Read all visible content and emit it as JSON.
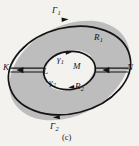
{
  "figure": {
    "caption": "(c)",
    "background_color": "#f4f2ef",
    "region_fill_color": "#bdbdbd",
    "hole_fill_color": "#f4f2ef",
    "stroke_color": "#141414",
    "labels": {
      "outer_top_curve": "Γ",
      "outer_top_curve_sub": "1",
      "outer_bottom_curve": "Γ",
      "outer_bottom_curve_sub": "2",
      "inner_top_curve": "γ",
      "inner_top_curve_sub": "1",
      "inner_bottom_curve": "γ",
      "inner_bottom_curve_sub": "2",
      "region_upper": "R",
      "region_upper_sub": "1",
      "region_lower": "R",
      "region_lower_sub": "2",
      "point_left": "K",
      "point_inner_left": "L",
      "point_inner_right": "M",
      "point_right": "N"
    },
    "icons": {
      "arrow_outer_top": "arrow-right-icon",
      "arrow_outer_bottom": "arrow-left-icon",
      "arrow_inner_top": "arrow-right-icon",
      "arrow_inner_bottom": "arrow-left-icon",
      "arrow_cut_left": "arrow-left-icon",
      "arrow_cut_right": "arrow-left-icon"
    }
  }
}
